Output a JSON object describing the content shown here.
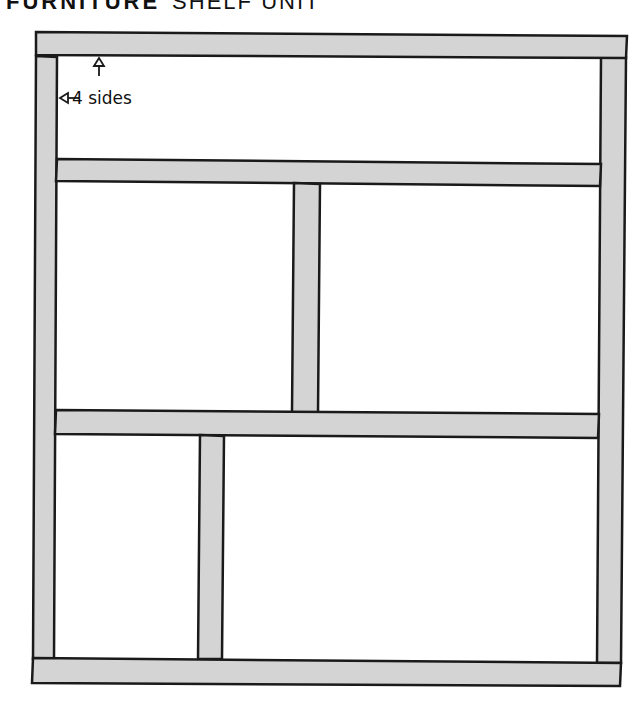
{
  "title": {
    "main": "FURNITURE",
    "sub": "SHELF UNIT"
  },
  "annotation": {
    "label": "4 sides",
    "arrows": [
      "up-arrow",
      "left-arrow"
    ]
  },
  "colors": {
    "board_fill": "#d4d4d4",
    "outline": "#1a1a1a",
    "background": "#ffffff"
  },
  "boards": [
    {
      "name": "top-board",
      "orientation": "horizontal"
    },
    {
      "name": "left-side-board",
      "orientation": "vertical"
    },
    {
      "name": "right-side-board",
      "orientation": "vertical"
    },
    {
      "name": "shelf-1",
      "orientation": "horizontal"
    },
    {
      "name": "divider-upper",
      "orientation": "vertical"
    },
    {
      "name": "shelf-2",
      "orientation": "horizontal"
    },
    {
      "name": "divider-lower",
      "orientation": "vertical"
    },
    {
      "name": "bottom-board",
      "orientation": "horizontal"
    }
  ]
}
